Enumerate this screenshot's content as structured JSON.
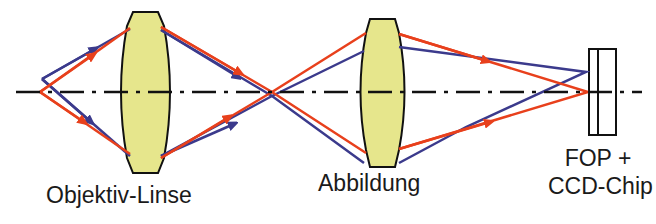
{
  "labels": {
    "objective_lens": "Objektiv-Linse",
    "imaging_lens": "Abbildung",
    "fop_line1": "FOP +",
    "fop_line2": "CCD-Chip"
  },
  "colors": {
    "red_ray": "#e8401c",
    "blue_ray": "#3b3a8c",
    "lens_fill": "#e6e68c",
    "outline": "#111111",
    "axis": "#111111"
  },
  "elements": [
    {
      "name": "objective-lens",
      "type": "biconvex-lens"
    },
    {
      "name": "imaging-lens",
      "type": "biconvex-lens"
    },
    {
      "name": "fop-ccd-chip",
      "type": "detector"
    },
    {
      "name": "optical-axis",
      "type": "dash-dot-line"
    },
    {
      "name": "red-ray-bundle",
      "type": "ray"
    },
    {
      "name": "blue-ray-bundle",
      "type": "ray"
    }
  ]
}
